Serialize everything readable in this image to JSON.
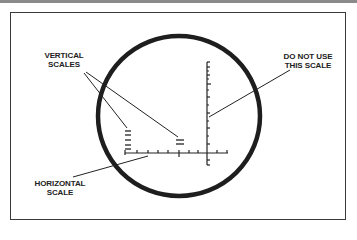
{
  "figure": {
    "labels": {
      "vertical_scales": [
        "VERTICAL",
        "SCALES"
      ],
      "do_not_use": [
        "DO NOT USE",
        "THIS SCALE"
      ],
      "horizontal_scale": [
        "HORIZONTAL",
        "SCALE"
      ]
    },
    "caption": "",
    "colors": {
      "ink": "#222222",
      "frame": "#3a3a3a",
      "background": "#ffffff"
    }
  }
}
